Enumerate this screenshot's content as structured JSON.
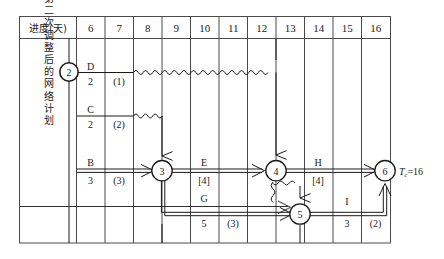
{
  "diagram": {
    "title_cell": "进度(天)",
    "row_label": "第二次调整后的网络计划",
    "total_duration_label": "T",
    "total_duration_sub": "c",
    "total_duration_value": "=16",
    "columns": [
      "6",
      "7",
      "8",
      "9",
      "10",
      "11",
      "12",
      "13",
      "14",
      "15",
      "16"
    ],
    "nodes": [
      {
        "id": "2",
        "label": "2"
      },
      {
        "id": "3",
        "label": "3"
      },
      {
        "id": "4",
        "label": "4"
      },
      {
        "id": "5",
        "label": "5"
      },
      {
        "id": "6",
        "label": "6"
      }
    ],
    "activities": [
      {
        "name": "D",
        "duration": "2",
        "float": "(1)"
      },
      {
        "name": "C",
        "duration": "2",
        "float": "(2)"
      },
      {
        "name": "B",
        "duration": "3",
        "float": "(3)"
      },
      {
        "name": "E",
        "duration": "[4]",
        "float": ""
      },
      {
        "name": "G",
        "duration": "5",
        "float": "(3)"
      },
      {
        "name": "H",
        "duration": "[4]",
        "float": ""
      },
      {
        "name": "I",
        "duration": "3",
        "float": "(2)"
      }
    ],
    "colors": {
      "line": "#1a1a1a",
      "border": "#4a4a4a",
      "bg": "#ffffff"
    }
  }
}
